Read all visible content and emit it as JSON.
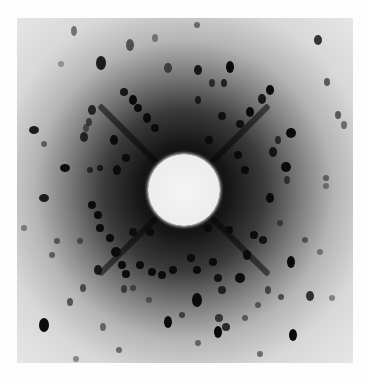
{
  "image": {
    "description": "Laue X-ray diffraction pattern with central beam stop",
    "frame": {
      "x": 17,
      "y": 18,
      "width": 336,
      "height": 345
    },
    "beam_stop": {
      "cx": 184,
      "cy": 190,
      "r": 36
    },
    "colors": {
      "border": "#fdfdfd",
      "background_outer": "#ebebeb",
      "background_center": "#0a0a0a",
      "spot": "#0b0b0b",
      "beam_stop": "#f2f2f2"
    },
    "streaks": [
      {
        "x": 184,
        "y": 190,
        "angle": -45,
        "len": 120
      },
      {
        "x": 184,
        "y": 190,
        "angle": -135,
        "len": 120
      },
      {
        "x": 184,
        "y": 190,
        "angle": 45,
        "len": 120
      },
      {
        "x": 184,
        "y": 190,
        "angle": 135,
        "len": 120
      }
    ],
    "spots": [
      [
        101,
        63,
        5,
        7,
        0.9
      ],
      [
        74,
        31,
        3,
        5,
        0.5
      ],
      [
        130,
        45,
        4,
        6,
        0.6
      ],
      [
        155,
        38,
        3,
        4,
        0.4
      ],
      [
        168,
        68,
        4,
        5,
        0.6
      ],
      [
        61,
        64,
        3,
        3,
        0.3
      ],
      [
        92,
        110,
        4,
        5,
        0.8
      ],
      [
        89,
        122,
        3,
        4,
        0.6
      ],
      [
        86,
        128,
        3,
        4,
        0.5
      ],
      [
        84,
        137,
        4,
        5,
        0.8
      ],
      [
        34,
        130,
        5,
        4,
        0.9
      ],
      [
        44,
        144,
        3,
        3,
        0.5
      ],
      [
        65,
        168,
        5,
        4,
        1.0
      ],
      [
        124,
        92,
        4,
        4,
        0.9
      ],
      [
        133,
        100,
        4,
        5,
        1.0
      ],
      [
        138,
        108,
        4,
        4,
        1.0
      ],
      [
        147,
        118,
        4,
        5,
        1.0
      ],
      [
        155,
        128,
        4,
        4,
        1.0
      ],
      [
        114,
        140,
        4,
        5,
        1.0
      ],
      [
        126,
        158,
        4,
        4,
        1.0
      ],
      [
        117,
        170,
        4,
        5,
        1.0
      ],
      [
        100,
        168,
        3,
        3,
        0.8
      ],
      [
        90,
        170,
        3,
        3,
        0.7
      ],
      [
        184,
        14,
        3,
        3,
        0.3
      ],
      [
        197,
        25,
        3,
        3,
        0.5
      ],
      [
        198,
        70,
        4,
        5,
        0.9
      ],
      [
        230,
        67,
        4,
        6,
        1.0
      ],
      [
        224,
        83,
        3,
        4,
        0.8
      ],
      [
        212,
        83,
        3,
        4,
        0.7
      ],
      [
        198,
        100,
        3,
        4,
        0.8
      ],
      [
        270,
        90,
        4,
        5,
        1.0
      ],
      [
        262,
        99,
        4,
        5,
        0.9
      ],
      [
        250,
        112,
        4,
        5,
        1.0
      ],
      [
        240,
        124,
        4,
        4,
        0.9
      ],
      [
        318,
        40,
        4,
        5,
        0.8
      ],
      [
        327,
        82,
        3,
        4,
        0.6
      ],
      [
        338,
        115,
        3,
        4,
        0.6
      ],
      [
        344,
        125,
        3,
        4,
        0.5
      ],
      [
        291,
        133,
        5,
        5,
        1.0
      ],
      [
        278,
        140,
        3,
        4,
        0.7
      ],
      [
        273,
        152,
        4,
        5,
        0.9
      ],
      [
        286,
        167,
        5,
        5,
        1.0
      ],
      [
        287,
        180,
        3,
        4,
        0.6
      ],
      [
        326,
        178,
        3,
        3,
        0.5
      ],
      [
        326,
        186,
        3,
        3,
        0.4
      ],
      [
        222,
        116,
        4,
        4,
        0.9
      ],
      [
        209,
        140,
        4,
        4,
        1.0
      ],
      [
        238,
        155,
        4,
        4,
        1.0
      ],
      [
        245,
        170,
        4,
        4,
        1.0
      ],
      [
        44,
        198,
        5,
        4,
        0.9
      ],
      [
        92,
        205,
        4,
        4,
        1.0
      ],
      [
        98,
        215,
        4,
        4,
        1.0
      ],
      [
        100,
        228,
        4,
        4,
        1.0
      ],
      [
        110,
        238,
        4,
        4,
        1.0
      ],
      [
        116,
        252,
        5,
        5,
        1.0
      ],
      [
        122,
        265,
        4,
        4,
        1.0
      ],
      [
        126,
        274,
        4,
        4,
        1.0
      ],
      [
        140,
        265,
        4,
        4,
        1.0
      ],
      [
        152,
        272,
        4,
        4,
        1.0
      ],
      [
        162,
        275,
        4,
        4,
        1.0
      ],
      [
        173,
        270,
        4,
        4,
        1.0
      ],
      [
        150,
        232,
        4,
        4,
        1.0
      ],
      [
        133,
        232,
        4,
        4,
        0.9
      ],
      [
        24,
        228,
        3,
        3,
        0.4
      ],
      [
        57,
        241,
        3,
        3,
        0.5
      ],
      [
        52,
        255,
        3,
        3,
        0.5
      ],
      [
        80,
        241,
        3,
        3,
        0.5
      ],
      [
        98,
        270,
        4,
        5,
        0.9
      ],
      [
        83,
        288,
        3,
        4,
        0.6
      ],
      [
        70,
        302,
        3,
        4,
        0.6
      ],
      [
        124,
        289,
        3,
        4,
        0.6
      ],
      [
        133,
        288,
        3,
        3,
        0.5
      ],
      [
        149,
        300,
        3,
        3,
        0.4
      ],
      [
        44,
        325,
        5,
        7,
        1.0
      ],
      [
        103,
        327,
        3,
        4,
        0.5
      ],
      [
        119,
        350,
        3,
        3,
        0.5
      ],
      [
        76,
        359,
        3,
        3,
        0.4
      ],
      [
        168,
        322,
        4,
        6,
        1.0
      ],
      [
        191,
        258,
        4,
        4,
        1.0
      ],
      [
        197,
        270,
        4,
        4,
        1.0
      ],
      [
        213,
        262,
        4,
        4,
        1.0
      ],
      [
        218,
        278,
        4,
        4,
        0.9
      ],
      [
        222,
        290,
        4,
        4,
        0.8
      ],
      [
        240,
        278,
        5,
        5,
        1.0
      ],
      [
        247,
        255,
        4,
        5,
        1.0
      ],
      [
        270,
        198,
        4,
        5,
        1.0
      ],
      [
        291,
        262,
        4,
        6,
        1.0
      ],
      [
        280,
        223,
        3,
        3,
        0.5
      ],
      [
        305,
        240,
        3,
        3,
        0.5
      ],
      [
        310,
        296,
        4,
        5,
        0.8
      ],
      [
        332,
        298,
        3,
        3,
        0.4
      ],
      [
        320,
        252,
        3,
        3,
        0.4
      ],
      [
        263,
        240,
        4,
        4,
        0.9
      ],
      [
        197,
        300,
        5,
        7,
        1.0
      ],
      [
        219,
        318,
        4,
        4,
        0.7
      ],
      [
        226,
        327,
        4,
        4,
        0.8
      ],
      [
        260,
        354,
        3,
        3,
        0.5
      ],
      [
        293,
        335,
        4,
        6,
        1.0
      ],
      [
        198,
        343,
        3,
        3,
        0.5
      ],
      [
        182,
        315,
        3,
        3,
        0.6
      ],
      [
        208,
        228,
        4,
        4,
        1.0
      ],
      [
        229,
        230,
        4,
        4,
        1.0
      ],
      [
        254,
        235,
        4,
        4,
        1.0
      ],
      [
        268,
        290,
        3,
        4,
        0.6
      ],
      [
        281,
        297,
        3,
        3,
        0.6
      ],
      [
        258,
        305,
        3,
        3,
        0.5
      ],
      [
        245,
        318,
        3,
        3,
        0.5
      ],
      [
        218,
        332,
        4,
        6,
        1.0
      ]
    ]
  }
}
